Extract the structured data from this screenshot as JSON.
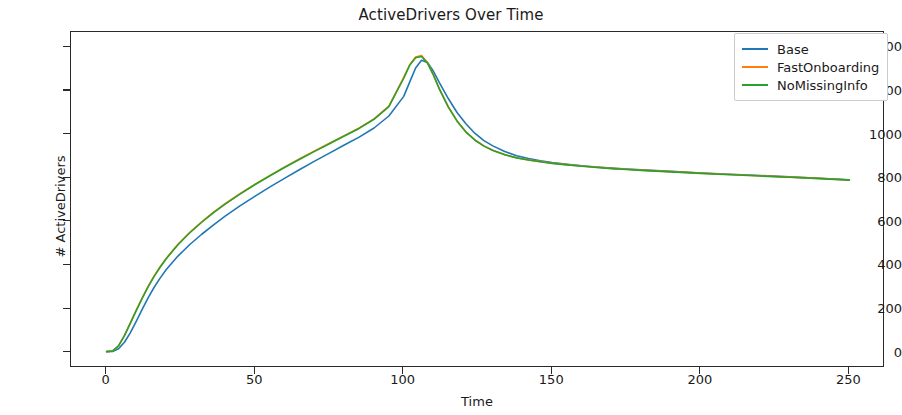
{
  "chart_data": {
    "type": "line",
    "title": "ActiveDrivers Over Time",
    "xlabel": "Time",
    "ylabel": "# ActiveDrivers",
    "xlim": [
      -12,
      262
    ],
    "ylim": [
      -70,
      1470
    ],
    "xticks": [
      0,
      50,
      100,
      150,
      200,
      250
    ],
    "yticks": [
      0,
      200,
      400,
      600,
      800,
      1000,
      1200,
      1400
    ],
    "grid": false,
    "legend_position": "upper right",
    "x": [
      0,
      2,
      4,
      6,
      8,
      10,
      12,
      14,
      16,
      18,
      20,
      24,
      28,
      32,
      36,
      40,
      45,
      50,
      55,
      60,
      65,
      70,
      75,
      80,
      85,
      90,
      95,
      100,
      102,
      104,
      106,
      108,
      110,
      112,
      115,
      118,
      121,
      124,
      127,
      130,
      134,
      138,
      142,
      146,
      150,
      155,
      160,
      165,
      170,
      175,
      180,
      190,
      200,
      210,
      220,
      230,
      240,
      250
    ],
    "series": [
      {
        "name": "Base",
        "color": "#1f77b4",
        "values": [
          5,
          6,
          18,
          48,
          92,
          145,
          200,
          253,
          300,
          342,
          380,
          443,
          496,
          543,
          586,
          627,
          674,
          718,
          760,
          800,
          840,
          878,
          915,
          952,
          988,
          1030,
          1085,
          1175,
          1240,
          1305,
          1340,
          1330,
          1290,
          1238,
          1165,
          1100,
          1048,
          1005,
          972,
          948,
          922,
          903,
          890,
          880,
          872,
          864,
          857,
          851,
          846,
          842,
          838,
          831,
          824,
          818,
          812,
          806,
          800,
          793
        ]
      },
      {
        "name": "FastOnboarding",
        "color": "#ff7f0e",
        "values": [
          5,
          8,
          32,
          80,
          138,
          196,
          252,
          305,
          352,
          394,
          432,
          497,
          552,
          600,
          644,
          684,
          730,
          773,
          813,
          852,
          889,
          925,
          960,
          995,
          1030,
          1072,
          1130,
          1262,
          1320,
          1355,
          1362,
          1330,
          1275,
          1210,
          1128,
          1062,
          1012,
          975,
          948,
          928,
          908,
          894,
          884,
          876,
          869,
          862,
          856,
          850,
          845,
          841,
          837,
          830,
          823,
          817,
          811,
          805,
          799,
          792
        ]
      },
      {
        "name": "NoMissingInfo",
        "color": "#2ca02c",
        "values": [
          5,
          8,
          31,
          78,
          136,
          194,
          250,
          303,
          350,
          392,
          430,
          495,
          550,
          598,
          642,
          682,
          728,
          771,
          811,
          850,
          887,
          923,
          958,
          993,
          1028,
          1070,
          1128,
          1258,
          1317,
          1352,
          1358,
          1327,
          1272,
          1208,
          1126,
          1060,
          1010,
          974,
          947,
          927,
          907,
          893,
          883,
          875,
          868,
          861,
          855,
          849,
          844,
          840,
          836,
          829,
          822,
          816,
          810,
          804,
          798,
          791
        ]
      }
    ]
  }
}
